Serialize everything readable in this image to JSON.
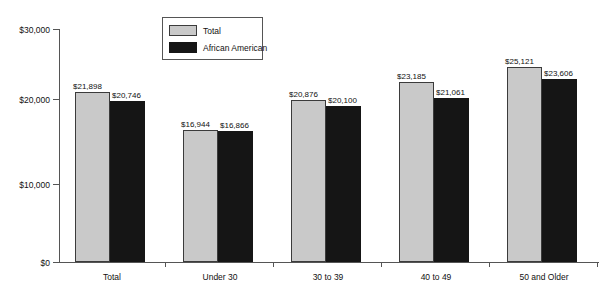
{
  "chart_data": {
    "type": "bar",
    "title": "",
    "subtitle": "",
    "xlabel": "",
    "ylabel": "",
    "categories": [
      "Total",
      "Under 30",
      "30 to 39",
      "40 to 49",
      "50 and Older"
    ],
    "series": [
      {
        "name": "Total",
        "color": "#c9c9c9",
        "values": [
          21898,
          16944,
          20876,
          23185,
          25121
        ],
        "labels": [
          "$21,898",
          "$16,944",
          "$20,876",
          "$23,185",
          "$25,121"
        ]
      },
      {
        "name": "African American",
        "color": "#151515",
        "values": [
          20746,
          16866,
          20100,
          21061,
          23606
        ],
        "labels": [
          "$20,746",
          "$16,866",
          "$20,100",
          "$21,061",
          "$23,606"
        ]
      }
    ],
    "ylim": [
      0,
      30000
    ],
    "yticks": [
      0,
      10000,
      20000,
      30000
    ],
    "ytick_labels": [
      "$0",
      "$10,000",
      "$20,000",
      "$30,000"
    ],
    "grid": false,
    "legend_position": "top-center"
  },
  "legend": {
    "items": [
      {
        "label": "Total",
        "swatch": "gray-swatch"
      },
      {
        "label": "African American",
        "swatch": "black-swatch"
      }
    ]
  }
}
